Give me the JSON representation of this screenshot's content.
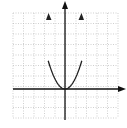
{
  "chart_data": {
    "type": "line",
    "title": "",
    "xlabel": "",
    "ylabel": "",
    "grid": true,
    "grid_style": "dotted",
    "xlim": [
      -5,
      5
    ],
    "ylim": [
      -3,
      7
    ],
    "series": [
      {
        "name": "y = x^2 (parabola, vertex at origin)",
        "x": [
          -1.6,
          -1.2,
          -0.8,
          -0.4,
          0,
          0.4,
          0.8,
          1.2,
          1.6
        ],
        "y": [
          6.8,
          3.84,
          1.7,
          0.43,
          0,
          0.43,
          1.7,
          3.84,
          6.8
        ]
      }
    ],
    "axes": {
      "x_arrow": "right",
      "y_arrow": "up",
      "curve_arrows": "both-up"
    }
  },
  "colors": {
    "axis": "#111111",
    "curve": "#222222",
    "grid": "#bbbbbb"
  }
}
